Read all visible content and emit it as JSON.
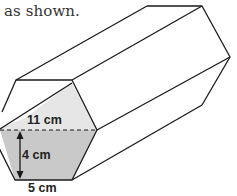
{
  "caption": "as shown.",
  "figure": {
    "shape": "hexagonal prism",
    "labels": {
      "top_width": "11 cm",
      "height": "4 cm",
      "bottom_width": "5 cm"
    },
    "colors": {
      "stroke": "#1a1a1a",
      "upper_fill": "#e6e6e6",
      "lower_fill": "#c9c9c9"
    }
  }
}
